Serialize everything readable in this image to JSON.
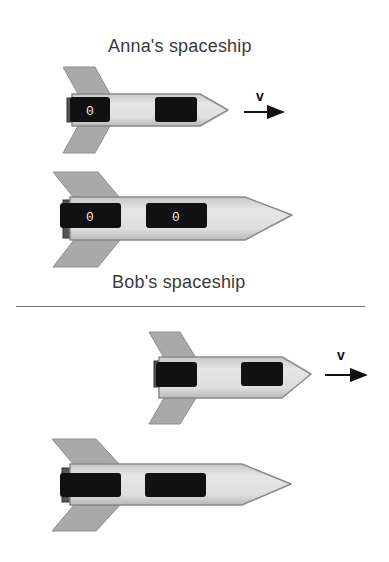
{
  "frames": [
    {
      "label": "Anna's spaceship",
      "moving_ship": {
        "role": "Anna",
        "velocity_label": "v",
        "clock_readings": [
          "0",
          ""
        ]
      },
      "rest_ship": {
        "role": "Bob",
        "clock_readings": [
          "0",
          "0"
        ]
      }
    },
    {
      "label": "Bob's spaceship",
      "moving_ship": {
        "role": "Anna",
        "velocity_label": "v",
        "clock_readings": [
          "",
          ""
        ]
      },
      "rest_ship": {
        "role": "Bob",
        "clock_readings": [
          "",
          ""
        ]
      }
    }
  ],
  "colors": {
    "hull": "#dcdcdc",
    "hull_outline": "#8a8a8a",
    "fin": "#a8a8a8",
    "window": "#111111",
    "digit": "#e8e8e8",
    "text": "#3a3a3a"
  }
}
